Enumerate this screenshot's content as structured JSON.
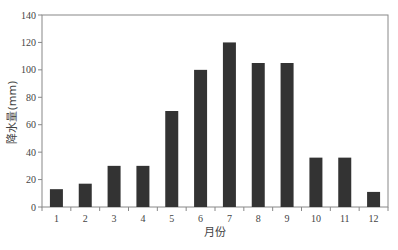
{
  "chart_data": {
    "type": "bar",
    "title": "",
    "xlabel": "月份",
    "ylabel": "降水量(mm)",
    "categories": [
      "1",
      "2",
      "3",
      "4",
      "5",
      "6",
      "7",
      "8",
      "9",
      "10",
      "11",
      "12"
    ],
    "values": [
      13,
      17,
      30,
      30,
      70,
      100,
      120,
      105,
      105,
      36,
      36,
      11
    ],
    "ylim": [
      0,
      140
    ],
    "yticks": [
      0,
      20,
      40,
      60,
      80,
      100,
      120,
      140
    ],
    "grid": false,
    "legend": null,
    "bar_color": "#333333",
    "axis_color": "#888888"
  }
}
